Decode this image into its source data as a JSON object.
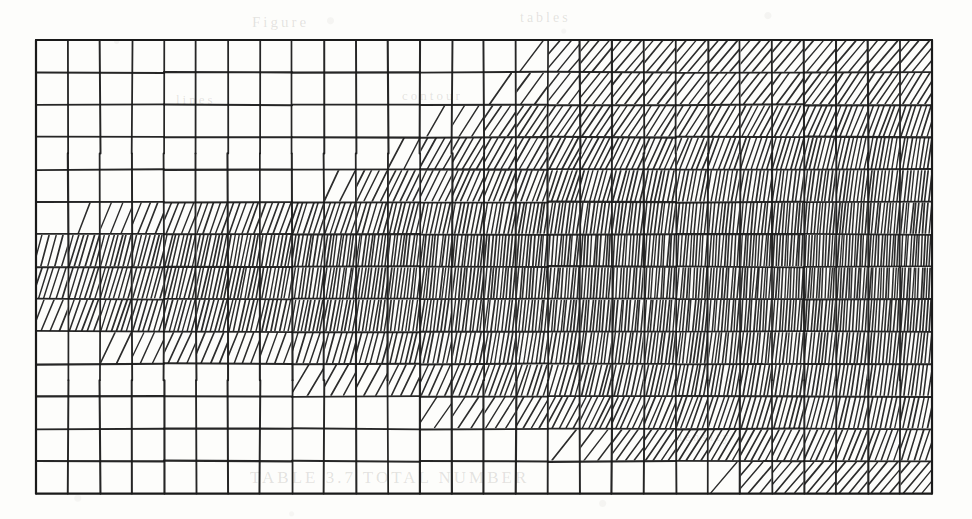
{
  "figure": {
    "kind": "hatched-grid-mesh",
    "background_color": "#fdfdfb",
    "ink_color": "#1a1a1a",
    "grid": {
      "origin_x": 36,
      "origin_y": 40,
      "cell_width": 32,
      "cell_height": 32.4,
      "columns": 28,
      "rows": 14,
      "border_width": 2.2,
      "line_width": 1.7,
      "hatch_line_width": 1.35
    },
    "bleed_through_text": [
      {
        "text": "Figure",
        "x": 252,
        "y": 14,
        "size": 15
      },
      {
        "text": "tables",
        "x": 520,
        "y": 10,
        "size": 14
      },
      {
        "text": "lines",
        "x": 176,
        "y": 92,
        "size": 13
      },
      {
        "text": "contour",
        "x": 402,
        "y": 88,
        "size": 13
      },
      {
        "text": "TABLE  3.7    TOTAL   NUMBER",
        "x": 250,
        "y": 468,
        "size": 17
      },
      {
        "text": "density",
        "x": 676,
        "y": 430,
        "size": 12
      }
    ],
    "chart_data": {
      "type": "heatmap",
      "title": "",
      "subtitle": "",
      "xlabel": "",
      "ylabel": "",
      "description": "Rectangular mesh of 28 columns by 14 rows; each cell is filled with parallel hatch strokes whose count (density) and slant angle vary smoothly across the field. Zero count means the cell is left blank. Density is highest in the two central rows and along the right-hand edge, and falls to zero toward the upper-left and lower-left corners.",
      "grid_on": true,
      "legend": "none",
      "xlim": [
        0,
        28
      ],
      "ylim": [
        0,
        14
      ],
      "value_key": "hatch stroke count per cell",
      "angle_key": "hatch slant in degrees from vertical (positive leans right at top)",
      "columns": 28,
      "rows": 14,
      "row_labels": [
        "1",
        "2",
        "3",
        "4",
        "5",
        "6",
        "7",
        "8",
        "9",
        "10",
        "11",
        "12",
        "13",
        "14"
      ],
      "column_labels": [
        "1",
        "2",
        "3",
        "4",
        "5",
        "6",
        "7",
        "8",
        "9",
        "10",
        "11",
        "12",
        "13",
        "14",
        "15",
        "16",
        "17",
        "18",
        "19",
        "20",
        "21",
        "22",
        "23",
        "24",
        "25",
        "26",
        "27",
        "28"
      ],
      "counts": [
        [
          0,
          0,
          0,
          0,
          0,
          0,
          0,
          0,
          0,
          0,
          0,
          0,
          0,
          0,
          0,
          1,
          4,
          5,
          5,
          5,
          5,
          5,
          5,
          5,
          5,
          5,
          5,
          5
        ],
        [
          0,
          0,
          0,
          0,
          0,
          0,
          0,
          0,
          0,
          0,
          0,
          0,
          0,
          0,
          1,
          3,
          4,
          5,
          5,
          5,
          5,
          5,
          5,
          5,
          6,
          6,
          6,
          6
        ],
        [
          0,
          0,
          0,
          0,
          0,
          0,
          0,
          0,
          0,
          0,
          0,
          0,
          1,
          3,
          5,
          6,
          6,
          6,
          6,
          6,
          6,
          6,
          7,
          7,
          7,
          7,
          7,
          7
        ],
        [
          0,
          0,
          0,
          0,
          0,
          0,
          0,
          0,
          0,
          0,
          0,
          2,
          5,
          6,
          6,
          6,
          7,
          7,
          7,
          7,
          7,
          7,
          7,
          8,
          8,
          8,
          8,
          8
        ],
        [
          0,
          0,
          0,
          0,
          0,
          0,
          0,
          0,
          0,
          2,
          5,
          6,
          6,
          7,
          7,
          7,
          8,
          8,
          8,
          8,
          8,
          8,
          8,
          8,
          9,
          9,
          9,
          9
        ],
        [
          0,
          1,
          3,
          4,
          5,
          6,
          6,
          6,
          7,
          7,
          7,
          8,
          8,
          8,
          8,
          9,
          9,
          9,
          9,
          9,
          9,
          9,
          9,
          10,
          10,
          10,
          10,
          10
        ],
        [
          5,
          7,
          8,
          8,
          9,
          9,
          9,
          9,
          9,
          10,
          10,
          10,
          10,
          10,
          10,
          10,
          10,
          10,
          10,
          10,
          10,
          10,
          11,
          11,
          11,
          11,
          11,
          11
        ],
        [
          6,
          7,
          8,
          8,
          9,
          9,
          9,
          9,
          9,
          10,
          10,
          10,
          10,
          10,
          10,
          10,
          10,
          10,
          10,
          10,
          10,
          10,
          11,
          11,
          11,
          11,
          11,
          11
        ],
        [
          4,
          6,
          7,
          7,
          8,
          8,
          8,
          8,
          9,
          9,
          9,
          9,
          9,
          9,
          9,
          10,
          10,
          10,
          10,
          10,
          10,
          10,
          10,
          10,
          10,
          10,
          10,
          10
        ],
        [
          0,
          0,
          2,
          3,
          4,
          4,
          4,
          4,
          5,
          6,
          6,
          7,
          7,
          7,
          8,
          8,
          8,
          9,
          9,
          9,
          9,
          9,
          9,
          9,
          9,
          9,
          9,
          9
        ],
        [
          0,
          0,
          0,
          0,
          0,
          0,
          0,
          0,
          2,
          3,
          3,
          4,
          5,
          6,
          7,
          7,
          7,
          8,
          8,
          8,
          8,
          8,
          8,
          8,
          8,
          8,
          8,
          8
        ],
        [
          0,
          0,
          0,
          0,
          0,
          0,
          0,
          0,
          0,
          0,
          0,
          0,
          2,
          3,
          4,
          5,
          6,
          7,
          7,
          7,
          7,
          7,
          7,
          7,
          7,
          7,
          7,
          7
        ],
        [
          0,
          0,
          0,
          0,
          0,
          0,
          0,
          0,
          0,
          0,
          0,
          0,
          0,
          0,
          0,
          0,
          1,
          3,
          5,
          6,
          6,
          6,
          6,
          6,
          6,
          6,
          6,
          6
        ],
        [
          0,
          0,
          0,
          0,
          0,
          0,
          0,
          0,
          0,
          0,
          0,
          0,
          0,
          0,
          0,
          0,
          0,
          0,
          0,
          0,
          0,
          1,
          4,
          5,
          5,
          5,
          5,
          5
        ]
      ],
      "angles": [
        [
          0,
          0,
          0,
          0,
          0,
          0,
          0,
          0,
          0,
          0,
          0,
          0,
          0,
          0,
          0,
          38,
          40,
          40,
          40,
          40,
          40,
          40,
          40,
          40,
          40,
          40,
          40,
          40
        ],
        [
          0,
          0,
          0,
          0,
          0,
          0,
          0,
          0,
          0,
          0,
          0,
          0,
          0,
          0,
          34,
          36,
          38,
          38,
          38,
          38,
          38,
          38,
          38,
          36,
          36,
          34,
          34,
          32
        ],
        [
          0,
          0,
          0,
          0,
          0,
          0,
          0,
          0,
          0,
          0,
          0,
          0,
          30,
          32,
          34,
          34,
          34,
          34,
          34,
          32,
          32,
          30,
          28,
          26,
          24,
          22,
          20,
          18
        ],
        [
          0,
          0,
          0,
          0,
          0,
          0,
          0,
          0,
          0,
          0,
          0,
          28,
          30,
          30,
          30,
          30,
          28,
          28,
          26,
          24,
          22,
          20,
          18,
          16,
          14,
          12,
          10,
          9
        ],
        [
          0,
          0,
          0,
          0,
          0,
          0,
          0,
          0,
          0,
          26,
          26,
          26,
          26,
          24,
          22,
          20,
          18,
          16,
          14,
          12,
          11,
          10,
          9,
          8,
          8,
          7,
          7,
          6
        ],
        [
          0,
          22,
          22,
          22,
          22,
          20,
          20,
          20,
          18,
          18,
          16,
          14,
          12,
          11,
          10,
          9,
          8,
          8,
          7,
          7,
          6,
          6,
          6,
          5,
          5,
          5,
          5,
          5
        ],
        [
          16,
          16,
          15,
          14,
          13,
          12,
          11,
          10,
          9,
          8,
          8,
          7,
          6,
          6,
          5,
          5,
          5,
          4,
          4,
          4,
          4,
          4,
          4,
          3,
          3,
          3,
          3,
          3
        ],
        [
          18,
          17,
          16,
          15,
          14,
          12,
          11,
          10,
          9,
          8,
          8,
          7,
          6,
          6,
          5,
          5,
          5,
          4,
          4,
          4,
          4,
          4,
          4,
          3,
          3,
          3,
          3,
          3
        ],
        [
          22,
          20,
          18,
          17,
          15,
          14,
          13,
          12,
          11,
          10,
          9,
          8,
          8,
          7,
          7,
          6,
          6,
          5,
          5,
          5,
          5,
          4,
          4,
          4,
          4,
          4,
          4,
          4
        ],
        [
          0,
          0,
          26,
          25,
          24,
          22,
          21,
          20,
          18,
          16,
          15,
          14,
          12,
          11,
          10,
          9,
          9,
          8,
          8,
          7,
          7,
          7,
          6,
          6,
          6,
          6,
          6,
          6
        ],
        [
          0,
          0,
          0,
          0,
          0,
          0,
          0,
          0,
          30,
          29,
          28,
          26,
          24,
          22,
          20,
          18,
          16,
          14,
          13,
          12,
          11,
          10,
          10,
          9,
          9,
          9,
          8,
          8
        ],
        [
          0,
          0,
          0,
          0,
          0,
          0,
          0,
          0,
          0,
          0,
          0,
          0,
          34,
          33,
          32,
          30,
          28,
          26,
          24,
          22,
          20,
          18,
          16,
          15,
          14,
          13,
          12,
          12
        ],
        [
          0,
          0,
          0,
          0,
          0,
          0,
          0,
          0,
          0,
          0,
          0,
          0,
          0,
          0,
          0,
          0,
          38,
          37,
          36,
          34,
          32,
          30,
          28,
          26,
          24,
          22,
          20,
          18
        ],
        [
          0,
          0,
          0,
          0,
          0,
          0,
          0,
          0,
          0,
          0,
          0,
          0,
          0,
          0,
          0,
          0,
          0,
          0,
          0,
          0,
          0,
          40,
          40,
          40,
          40,
          40,
          40,
          40
        ]
      ]
    }
  }
}
